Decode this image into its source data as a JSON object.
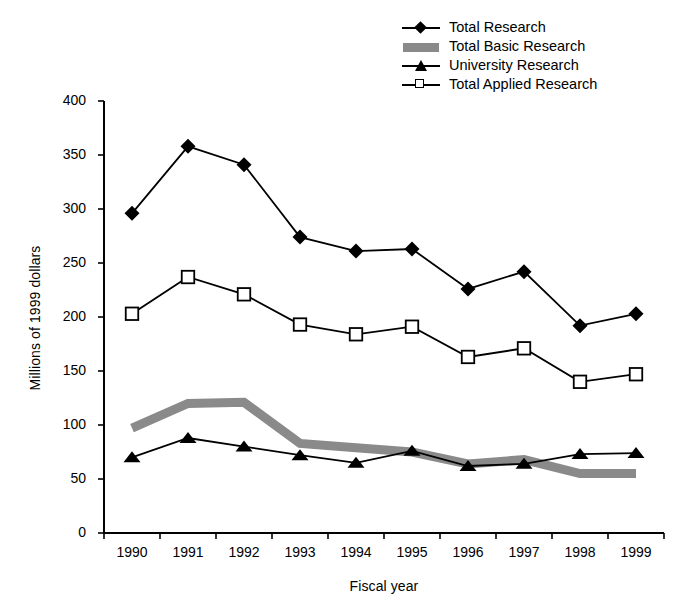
{
  "chart_data": {
    "type": "line",
    "title": "",
    "xlabel": "Fiscal year",
    "ylabel": "Millions of 1999 dollars",
    "categories": [
      "1990",
      "1991",
      "1992",
      "1993",
      "1994",
      "1995",
      "1996",
      "1997",
      "1998",
      "1999"
    ],
    "x": [
      1990,
      1991,
      1992,
      1993,
      1994,
      1995,
      1996,
      1997,
      1998,
      1999
    ],
    "xlim": [
      1989.5,
      1999.5
    ],
    "ylim": [
      0,
      400
    ],
    "yticks": [
      0,
      50,
      100,
      150,
      200,
      250,
      300,
      350,
      400
    ],
    "grid": false,
    "legend_position": "top-right",
    "series": [
      {
        "name": "Total Research",
        "marker": "filled-diamond",
        "color": "#000000",
        "values": [
          296,
          358,
          341,
          274,
          261,
          263,
          226,
          242,
          192,
          203
        ]
      },
      {
        "name": "Total Basic Research",
        "marker": "none",
        "style": "thick-gray-band",
        "color": "#8a8a8a",
        "values": [
          97,
          120,
          121,
          83,
          79,
          75,
          64,
          68,
          55,
          55
        ]
      },
      {
        "name": "University Research",
        "marker": "filled-triangle",
        "color": "#000000",
        "values": [
          70,
          88,
          80,
          72,
          65,
          76,
          62,
          64,
          73,
          74
        ]
      },
      {
        "name": "Total Applied Research",
        "marker": "open-square",
        "color": "#000000",
        "values": [
          203,
          237,
          221,
          193,
          184,
          191,
          163,
          171,
          140,
          147
        ]
      }
    ]
  },
  "legend": {
    "items": [
      {
        "label": "Total Research",
        "key": "diamond-marker-icon"
      },
      {
        "label": "Total Basic Research",
        "key": "gray-band-icon"
      },
      {
        "label": "University Research",
        "key": "triangle-marker-icon"
      },
      {
        "label": "Total Applied Research",
        "key": "square-marker-icon"
      }
    ]
  },
  "axes": {
    "y_title": "Millions of 1999 dollars",
    "x_title": "Fiscal year",
    "y_ticks": [
      "0",
      "50",
      "100",
      "150",
      "200",
      "250",
      "300",
      "350",
      "400"
    ],
    "x_ticks": [
      "1990",
      "1991",
      "1992",
      "1993",
      "1994",
      "1995",
      "1996",
      "1997",
      "1998",
      "1999"
    ]
  }
}
